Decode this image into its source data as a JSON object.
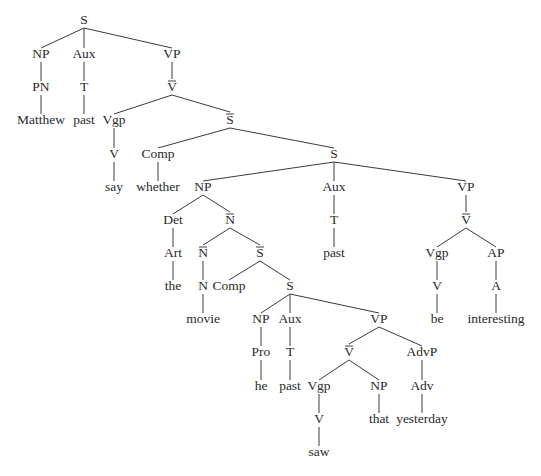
{
  "diagram": {
    "type": "syntax-tree",
    "nodes": [
      {
        "id": "s0",
        "label": "S",
        "x": 84,
        "y": 21
      },
      {
        "id": "np0",
        "label": "NP",
        "x": 41,
        "y": 55
      },
      {
        "id": "aux0",
        "label": "Aux",
        "x": 84,
        "y": 55
      },
      {
        "id": "vp0",
        "label": "VP",
        "x": 172,
        "y": 55
      },
      {
        "id": "pn0",
        "label": "PN",
        "x": 41,
        "y": 88
      },
      {
        "id": "t0",
        "label": "T",
        "x": 84,
        "y": 88
      },
      {
        "id": "vbar0",
        "label": "V",
        "bar": true,
        "x": 172,
        "y": 88
      },
      {
        "id": "w_matthew",
        "label": "Matthew",
        "x": 41,
        "y": 121
      },
      {
        "id": "w_past0",
        "label": "past",
        "x": 84,
        "y": 121
      },
      {
        "id": "vgp0",
        "label": "Vgp",
        "x": 114,
        "y": 121
      },
      {
        "id": "sbar0",
        "label": "S",
        "bar": true,
        "x": 230,
        "y": 121
      },
      {
        "id": "v0",
        "label": "V",
        "x": 114,
        "y": 155
      },
      {
        "id": "comp0",
        "label": "Comp",
        "x": 158,
        "y": 155
      },
      {
        "id": "s1",
        "label": "S",
        "x": 334,
        "y": 155
      },
      {
        "id": "w_say",
        "label": "say",
        "x": 114,
        "y": 188
      },
      {
        "id": "w_whether",
        "label": "whether",
        "x": 158,
        "y": 188
      },
      {
        "id": "np1",
        "label": "NP",
        "x": 203,
        "y": 188
      },
      {
        "id": "aux1",
        "label": "Aux",
        "x": 334,
        "y": 188
      },
      {
        "id": "vp1",
        "label": "VP",
        "x": 466,
        "y": 188
      },
      {
        "id": "det0",
        "label": "Det",
        "x": 173,
        "y": 221
      },
      {
        "id": "nbar0",
        "label": "N",
        "bar": true,
        "x": 230,
        "y": 221
      },
      {
        "id": "t1",
        "label": "T",
        "x": 334,
        "y": 221
      },
      {
        "id": "vbar1",
        "label": "V",
        "bar": true,
        "x": 466,
        "y": 221
      },
      {
        "id": "art0",
        "label": "Art",
        "x": 173,
        "y": 254
      },
      {
        "id": "nbar1",
        "label": "N",
        "bar": true,
        "x": 203,
        "y": 254
      },
      {
        "id": "sbar1",
        "label": "S",
        "bar": true,
        "x": 260,
        "y": 254
      },
      {
        "id": "w_past1",
        "label": "past",
        "x": 334,
        "y": 254
      },
      {
        "id": "vgp1",
        "label": "Vgp",
        "x": 437,
        "y": 254
      },
      {
        "id": "ap0",
        "label": "AP",
        "x": 496,
        "y": 254
      },
      {
        "id": "w_the",
        "label": "the",
        "x": 173,
        "y": 287
      },
      {
        "id": "n0",
        "label": "N",
        "x": 203,
        "y": 287
      },
      {
        "id": "comp1",
        "label": "Comp",
        "x": 229,
        "y": 287
      },
      {
        "id": "s2",
        "label": "S",
        "x": 290,
        "y": 287
      },
      {
        "id": "v1",
        "label": "V",
        "x": 437,
        "y": 287
      },
      {
        "id": "a0",
        "label": "A",
        "x": 496,
        "y": 287
      },
      {
        "id": "w_movie",
        "label": "movie",
        "x": 203,
        "y": 320
      },
      {
        "id": "np2",
        "label": "NP",
        "x": 261,
        "y": 320
      },
      {
        "id": "aux2",
        "label": "Aux",
        "x": 290,
        "y": 320
      },
      {
        "id": "vp2",
        "label": "VP",
        "x": 379,
        "y": 320
      },
      {
        "id": "w_be",
        "label": "be",
        "x": 437,
        "y": 320
      },
      {
        "id": "w_interesting",
        "label": "interesting",
        "x": 496,
        "y": 320
      },
      {
        "id": "pro0",
        "label": "Pro",
        "x": 261,
        "y": 353
      },
      {
        "id": "t2",
        "label": "T",
        "x": 290,
        "y": 353
      },
      {
        "id": "vbar2",
        "label": "V",
        "bar": true,
        "x": 349,
        "y": 353
      },
      {
        "id": "advp0",
        "label": "AdvP",
        "x": 422,
        "y": 353
      },
      {
        "id": "w_he",
        "label": "he",
        "x": 261,
        "y": 387
      },
      {
        "id": "w_past2",
        "label": "past",
        "x": 290,
        "y": 387
      },
      {
        "id": "vgp2",
        "label": "Vgp",
        "x": 319,
        "y": 387
      },
      {
        "id": "np3",
        "label": "NP",
        "x": 379,
        "y": 387
      },
      {
        "id": "adv0",
        "label": "Adv",
        "x": 422,
        "y": 387
      },
      {
        "id": "v2",
        "label": "V",
        "x": 319,
        "y": 420
      },
      {
        "id": "w_that",
        "label": "that",
        "x": 379,
        "y": 420
      },
      {
        "id": "w_yesterday",
        "label": "yesterday",
        "x": 422,
        "y": 420
      },
      {
        "id": "w_saw",
        "label": "saw",
        "x": 319,
        "y": 453
      }
    ],
    "edges": [
      [
        "s0",
        "np0"
      ],
      [
        "s0",
        "aux0"
      ],
      [
        "s0",
        "vp0"
      ],
      [
        "np0",
        "pn0"
      ],
      [
        "pn0",
        "w_matthew"
      ],
      [
        "aux0",
        "t0"
      ],
      [
        "t0",
        "w_past0"
      ],
      [
        "vp0",
        "vbar0"
      ],
      [
        "vbar0",
        "vgp0"
      ],
      [
        "vbar0",
        "sbar0"
      ],
      [
        "vgp0",
        "v0"
      ],
      [
        "v0",
        "w_say"
      ],
      [
        "sbar0",
        "comp0"
      ],
      [
        "sbar0",
        "s1"
      ],
      [
        "comp0",
        "w_whether"
      ],
      [
        "s1",
        "np1"
      ],
      [
        "s1",
        "aux1"
      ],
      [
        "s1",
        "vp1"
      ],
      [
        "np1",
        "det0"
      ],
      [
        "np1",
        "nbar0"
      ],
      [
        "det0",
        "art0"
      ],
      [
        "art0",
        "w_the"
      ],
      [
        "nbar0",
        "nbar1"
      ],
      [
        "nbar0",
        "sbar1"
      ],
      [
        "nbar1",
        "n0"
      ],
      [
        "n0",
        "w_movie"
      ],
      [
        "sbar1",
        "comp1"
      ],
      [
        "sbar1",
        "s2"
      ],
      [
        "s2",
        "np2"
      ],
      [
        "s2",
        "aux2"
      ],
      [
        "s2",
        "vp2"
      ],
      [
        "np2",
        "pro0"
      ],
      [
        "pro0",
        "w_he"
      ],
      [
        "aux2",
        "t2"
      ],
      [
        "t2",
        "w_past2"
      ],
      [
        "vp2",
        "vbar2"
      ],
      [
        "vp2",
        "advp0"
      ],
      [
        "vbar2",
        "vgp2"
      ],
      [
        "vbar2",
        "np3"
      ],
      [
        "vgp2",
        "v2"
      ],
      [
        "v2",
        "w_saw"
      ],
      [
        "np3",
        "w_that"
      ],
      [
        "advp0",
        "adv0"
      ],
      [
        "adv0",
        "w_yesterday"
      ],
      [
        "aux1",
        "t1"
      ],
      [
        "t1",
        "w_past1"
      ],
      [
        "vp1",
        "vbar1"
      ],
      [
        "vbar1",
        "vgp1"
      ],
      [
        "vbar1",
        "ap0"
      ],
      [
        "vgp1",
        "v1"
      ],
      [
        "v1",
        "w_be"
      ],
      [
        "ap0",
        "a0"
      ],
      [
        "a0",
        "w_interesting"
      ]
    ]
  }
}
